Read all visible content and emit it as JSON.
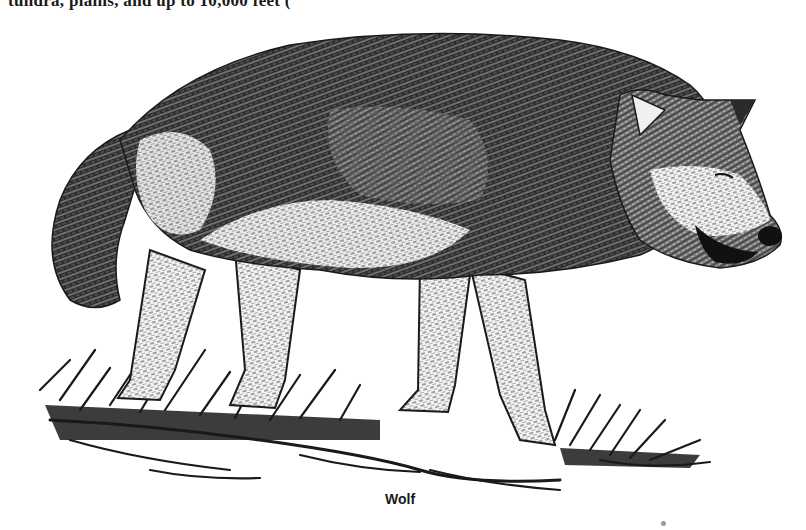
{
  "page": {
    "top_text_fragment": "tundra, plains, and up to 10,000 feet (",
    "figure": {
      "subject": "wolf",
      "style": "pen-and-ink illustration",
      "caption": "Wolf"
    },
    "colors": {
      "ink": "#1a1a1a",
      "paper": "#ffffff",
      "mid_gray": "#6b6b6b"
    }
  }
}
